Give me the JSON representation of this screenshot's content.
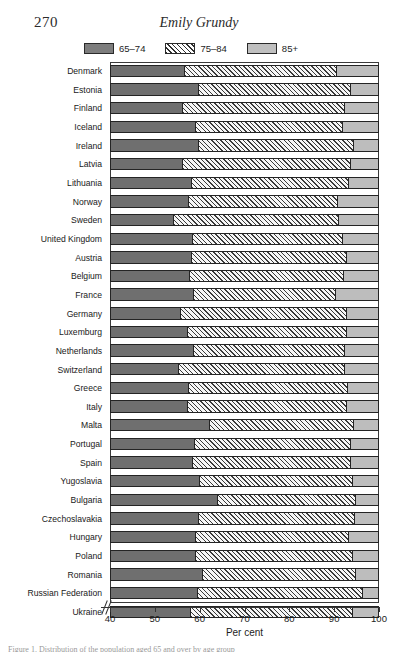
{
  "runhead": {
    "page_number": "270",
    "author": "Emily Grundy"
  },
  "legend": {
    "items": [
      {
        "label": "65–74",
        "swatch": "dark-gray-swatch",
        "color": "#7d7d7d"
      },
      {
        "label": "75–84",
        "swatch": "hatched-swatch",
        "color": "#ffffff"
      },
      {
        "label": "85+",
        "swatch": "light-gray-swatch",
        "color": "#c0c0c0"
      }
    ]
  },
  "axis": {
    "title": "Per cent",
    "ticks": [
      "40",
      "50",
      "60",
      "70",
      "80",
      "90",
      "100"
    ],
    "break_marker": "axis-break-slashes"
  },
  "caption": {
    "text": "Figure 1. Distribution of the population aged 65 and over by age group"
  },
  "chart_data": {
    "type": "bar",
    "orientation": "horizontal",
    "stacked": true,
    "title": "",
    "subtitle": "",
    "xlabel": "Per cent",
    "ylabel": "",
    "xlim": [
      40,
      100
    ],
    "xticks": [
      40,
      50,
      60,
      70,
      80,
      90,
      100
    ],
    "grid": false,
    "axis_break": true,
    "legend_position": "top",
    "categories": [
      "Denmark",
      "Estonia",
      "Finland",
      "Iceland",
      "Ireland",
      "Latvia",
      "Lithuania",
      "Norway",
      "Sweden",
      "United Kingdom",
      "Austria",
      "Belgium",
      "France",
      "Germany",
      "Luxemburg",
      "Netherlands",
      "Switzerland",
      "Greece",
      "Italy",
      "Malta",
      "Portugal",
      "Spain",
      "Yugoslavia",
      "Bulgaria",
      "Czechoslavakia",
      "Hungary",
      "Poland",
      "Romania",
      "Russian Federation",
      "Ukraine"
    ],
    "series": [
      {
        "name": "65–74",
        "color": "#6f6f6f",
        "values": [
          56.3,
          59.5,
          56.0,
          58.8,
          59.6,
          56.0,
          58.0,
          57.3,
          54.0,
          58.2,
          58.0,
          57.5,
          58.5,
          55.5,
          57.0,
          58.5,
          55.0,
          57.2,
          57.0,
          62.0,
          58.7,
          58.2,
          59.8,
          63.8,
          59.5,
          58.8,
          58.8,
          60.5,
          59.4,
          57.8
        ]
      },
      {
        "name": "75–84",
        "color": "#f4f4f4",
        "hatch": "diagonal",
        "values": [
          34.3,
          34.3,
          36.3,
          33.0,
          34.8,
          37.6,
          35.2,
          33.4,
          37.0,
          33.6,
          34.8,
          34.7,
          31.8,
          37.2,
          35.9,
          33.9,
          37.4,
          35.9,
          35.7,
          32.3,
          35.0,
          35.5,
          34.4,
          31.0,
          35.1,
          34.4,
          35.4,
          34.3,
          37.1,
          36.3
        ]
      },
      {
        "name": "85+",
        "color": "#bdbdbd",
        "values": [
          9.4,
          6.2,
          7.7,
          8.2,
          5.6,
          6.4,
          6.8,
          9.3,
          9.0,
          8.2,
          7.2,
          7.8,
          9.7,
          7.3,
          7.1,
          7.6,
          7.6,
          6.9,
          7.3,
          5.7,
          6.3,
          6.3,
          5.8,
          5.2,
          5.4,
          6.8,
          5.8,
          5.2,
          3.5,
          5.9
        ]
      }
    ]
  }
}
